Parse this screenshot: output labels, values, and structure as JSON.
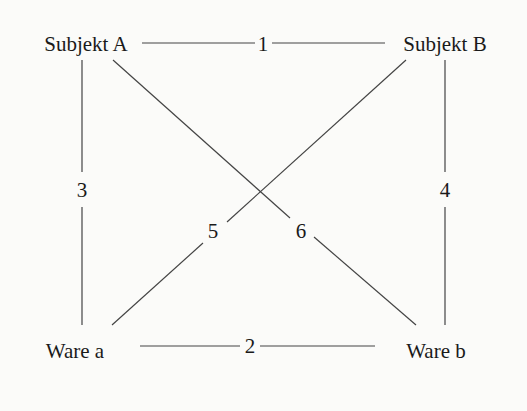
{
  "nodes": {
    "subjekt_a": {
      "label": "Subjekt A",
      "x": 86,
      "y": 43
    },
    "subjekt_b": {
      "label": "Subjekt B",
      "x": 445,
      "y": 43
    },
    "ware_a": {
      "label": "Ware a",
      "x": 75,
      "y": 352
    },
    "ware_b": {
      "label": "Ware b",
      "x": 436,
      "y": 352
    }
  },
  "edges": [
    {
      "id": "1",
      "label": "1",
      "from": "Subjekt A",
      "to": "Subjekt B",
      "x": 263,
      "y": 43
    },
    {
      "id": "2",
      "label": "2",
      "from": "Ware a",
      "to": "Ware b",
      "x": 250,
      "y": 346
    },
    {
      "id": "3",
      "label": "3",
      "from": "Subjekt A",
      "to": "Ware a",
      "x": 82,
      "y": 190
    },
    {
      "id": "4",
      "label": "4",
      "from": "Subjekt B",
      "to": "Ware b",
      "x": 445,
      "y": 190
    },
    {
      "id": "5",
      "label": "5",
      "from": "Subjekt B",
      "to": "Ware a",
      "x": 213,
      "y": 229
    },
    {
      "id": "6",
      "label": "6",
      "from": "Subjekt A",
      "to": "Ware b",
      "x": 301,
      "y": 229
    }
  ],
  "colors": {
    "line": "#444444",
    "text": "#1a1a1a",
    "background": "#fbfbf9"
  }
}
